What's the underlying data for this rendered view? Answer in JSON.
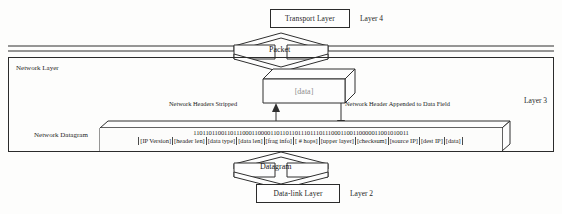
{
  "diagram": {
    "title_note": "Network layer encapsulation / decapsulation diagram",
    "layer4": {
      "box_label": "Transport Layer",
      "tag": "Layer 4"
    },
    "layer3": {
      "box_label": "Network Layer",
      "tag": "Layer 3",
      "datagram_label": "Network Datagram",
      "data_unit_label": "[data]",
      "annotation_left": "Network Headers Stripped",
      "annotation_right": "Network Header Appended to Data Field"
    },
    "layer2": {
      "box_label": "Data-link Layer",
      "tag": "Layer 2"
    },
    "band_top_label": "Packet",
    "band_bottom_label": "Datagram",
    "datagram": {
      "bit_string": "1101101100110111000110000110110110111011101110001100110000011001010011",
      "fields": [
        "[IP Version]",
        "[header len]",
        "[data type]",
        "[data len]",
        "[frag info]",
        "[ # hops]",
        "[upper layer]",
        "[checksum]",
        "[source IP]",
        "[dest IP]",
        "[data]"
      ]
    },
    "colors": {
      "ink": "#2b2b2b",
      "paper": "#fdfdfc",
      "data_text": "#8e8e8e"
    }
  }
}
